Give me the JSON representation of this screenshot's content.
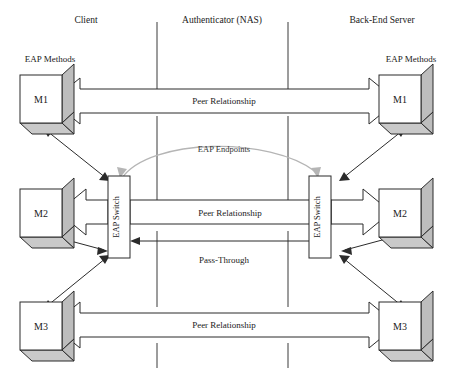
{
  "diagram": {
    "columns": {
      "client": "Client",
      "authenticator": "Authenticator (NAS)",
      "backend": "Back-End Server"
    },
    "group_labels": {
      "left_methods": "EAP Methods",
      "right_methods": "EAP Methods"
    },
    "client_methods": [
      {
        "name": "M1"
      },
      {
        "name": "M2"
      },
      {
        "name": "M3"
      }
    ],
    "server_methods": [
      {
        "name": "M1"
      },
      {
        "name": "M2"
      },
      {
        "name": "M3"
      }
    ],
    "switches": {
      "client_switch": "EAP Switch",
      "server_switch": "EAP Switch"
    },
    "relations": {
      "top_peer": "Peer Relationship",
      "middle_peer": "Peer Relationship",
      "bottom_peer": "Peer Relationship",
      "pass_through": "Pass-Through",
      "eap_endpoints": "EAP Endpoints"
    },
    "colors": {
      "stroke": "#2b2b2b",
      "cube_side": "#bdbdbd",
      "cube_bottom": "#c9c9c9",
      "fill": "#ffffff",
      "curve": "#b5b5b5",
      "text": "#1a1a1a"
    }
  }
}
